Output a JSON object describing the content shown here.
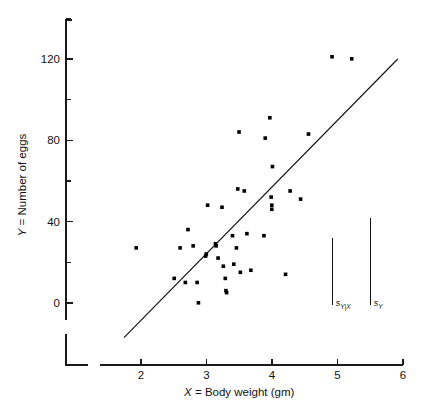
{
  "chart_data": {
    "type": "scatter",
    "title": "",
    "xlabel": "X = Body weight (gm)",
    "ylabel": "Y = Number of eggs",
    "xlim": [
      1.45,
      6.1
    ],
    "ylim": [
      -28,
      148
    ],
    "grid": false,
    "legend": "none",
    "x_ticks": [
      2,
      3,
      4,
      5,
      6
    ],
    "x_tick_labels": [
      "2",
      "3",
      "4",
      "5",
      "6"
    ],
    "y_ticks": [
      0,
      20,
      40,
      60,
      80,
      100,
      120,
      140
    ],
    "y_tick_labels": [
      "0",
      "",
      "40",
      "",
      "80",
      "",
      "120",
      ""
    ],
    "y_major_ticks": [
      0,
      40,
      80,
      120
    ],
    "points": [
      {
        "x": 1.93,
        "y": 27
      },
      {
        "x": 2.51,
        "y": 12
      },
      {
        "x": 2.6,
        "y": 27
      },
      {
        "x": 2.68,
        "y": 10
      },
      {
        "x": 2.72,
        "y": 36
      },
      {
        "x": 2.8,
        "y": 28
      },
      {
        "x": 2.86,
        "y": 10
      },
      {
        "x": 2.88,
        "y": 0
      },
      {
        "x": 2.99,
        "y": 23
      },
      {
        "x": 3.0,
        "y": 24
      },
      {
        "x": 3.02,
        "y": 48
      },
      {
        "x": 3.14,
        "y": 29
      },
      {
        "x": 3.15,
        "y": 28
      },
      {
        "x": 3.18,
        "y": 22
      },
      {
        "x": 3.24,
        "y": 47
      },
      {
        "x": 3.26,
        "y": 18
      },
      {
        "x": 3.29,
        "y": 12
      },
      {
        "x": 3.3,
        "y": 6
      },
      {
        "x": 3.31,
        "y": 5
      },
      {
        "x": 3.4,
        "y": 33
      },
      {
        "x": 3.42,
        "y": 19
      },
      {
        "x": 3.46,
        "y": 27
      },
      {
        "x": 3.48,
        "y": 56
      },
      {
        "x": 3.5,
        "y": 84
      },
      {
        "x": 3.52,
        "y": 15
      },
      {
        "x": 3.58,
        "y": 55
      },
      {
        "x": 3.62,
        "y": 34
      },
      {
        "x": 3.68,
        "y": 16
      },
      {
        "x": 3.88,
        "y": 33
      },
      {
        "x": 3.9,
        "y": 81
      },
      {
        "x": 3.97,
        "y": 91
      },
      {
        "x": 3.99,
        "y": 52
      },
      {
        "x": 4.0,
        "y": 46
      },
      {
        "x": 4.0,
        "y": 48
      },
      {
        "x": 4.01,
        "y": 67
      },
      {
        "x": 4.21,
        "y": 14
      },
      {
        "x": 4.28,
        "y": 55
      },
      {
        "x": 4.44,
        "y": 51
      },
      {
        "x": 4.56,
        "y": 83
      },
      {
        "x": 4.92,
        "y": 121
      },
      {
        "x": 5.22,
        "y": 120
      }
    ],
    "regression_line": {
      "x_start": 1.74,
      "y_start": -17,
      "x_end": 5.92,
      "y_end": 120
    },
    "reference_bars": [
      {
        "label": "s",
        "sub": "Y|X",
        "x": 4.92,
        "y_top": 32,
        "y_bottom": -1
      },
      {
        "label": "s",
        "sub": "Y",
        "x": 5.5,
        "y_top": 42,
        "y_bottom": -1
      }
    ]
  }
}
